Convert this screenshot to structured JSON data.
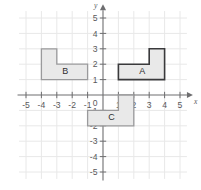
{
  "figure": {
    "background_color": "#ffffff",
    "grid_color": "#e8e8e8",
    "axis_color": "#6e6e70"
  },
  "axes": {
    "x_axis": {
      "name": "x",
      "min": -5.6,
      "max": 5.6,
      "tick_labels": [
        "-5",
        "-4",
        "-3",
        "-2",
        "-1",
        "0",
        "1",
        "2",
        "3",
        "4",
        "5"
      ],
      "tick_values": [
        -5,
        -4,
        -3,
        -2,
        -1,
        0,
        1,
        2,
        3,
        4,
        5
      ],
      "arrow": true
    },
    "y_axis": {
      "name": "y",
      "min": -5.6,
      "max": 5.6,
      "tick_labels": [
        "-5",
        "-4",
        "-3",
        "-2",
        "-1",
        "0",
        "1",
        "2",
        "3",
        "4",
        "5"
      ],
      "tick_values": [
        -5,
        -4,
        -3,
        -2,
        -1,
        0,
        1,
        2,
        3,
        4,
        5
      ],
      "arrow": true
    },
    "origin_label": "0"
  },
  "chart_data": {
    "type": "scatter",
    "xlabel": "x",
    "ylabel": "y",
    "xlim": [
      -5.6,
      5.6
    ],
    "ylim": [
      -5.6,
      5.6
    ],
    "grid": true,
    "legend": "none",
    "shapes": [
      {
        "label": "A",
        "fill": "#e9e9e9",
        "stroke": "#3a3a3c",
        "stroke_width": 1.6,
        "label_position": [
          2.55,
          1.5
        ],
        "vertices": [
          [
            1,
            1
          ],
          [
            4,
            1
          ],
          [
            4,
            3
          ],
          [
            3,
            3
          ],
          [
            3,
            2
          ],
          [
            1,
            2
          ]
        ]
      },
      {
        "label": "B",
        "fill": "#e9e9e9",
        "stroke": "#9a9a9c",
        "stroke_width": 1.3,
        "label_position": [
          -2.45,
          1.5
        ],
        "vertices": [
          [
            -4,
            1
          ],
          [
            -1,
            1
          ],
          [
            -1,
            2
          ],
          [
            -3,
            2
          ],
          [
            -3,
            3
          ],
          [
            -4,
            3
          ]
        ]
      },
      {
        "label": "C",
        "fill": "#e9e9e9",
        "stroke": "#9a9a9c",
        "stroke_width": 1.3,
        "label_position": [
          0.55,
          -1.5
        ],
        "vertices": [
          [
            -1,
            -2
          ],
          [
            2,
            -2
          ],
          [
            2,
            0
          ],
          [
            1,
            0
          ],
          [
            1,
            -1
          ],
          [
            -1,
            -1
          ]
        ]
      }
    ]
  }
}
